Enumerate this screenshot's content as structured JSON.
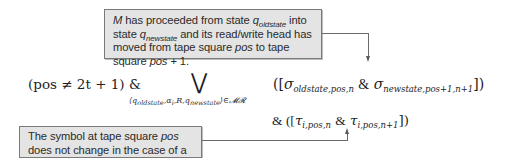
{
  "callouts": {
    "top": {
      "parts": [
        "M",
        " has proceeded from state ",
        "q",
        "oldstate",
        " into state ",
        "q",
        "newstate",
        " and its read/write head has moved from tape square ",
        "pos",
        " to tape square ",
        "pos",
        " + 1."
      ]
    },
    "bottom": {
      "parts": [
        "The symbol at tape square ",
        "pos",
        " does not change in the case of a move-right."
      ]
    }
  },
  "formula": {
    "condition": "(pos ≠ 2t + 1) &",
    "operator": "⋁",
    "range": "⟨q_oldstate, α_i, R, q_newstate⟩ ∈ 𝓜𝓡",
    "range_parts": [
      "⟨q",
      "oldstate",
      ",α",
      "i",
      ",R,q",
      "newstate",
      "⟩∈𝓜𝓡"
    ],
    "sigma_term": {
      "open": "([",
      "a_symbol": "σ",
      "a_sub": "oldstate,pos,n",
      "amp": "&",
      "b_symbol": "σ",
      "b_sub": "newstate,pos+1,n+1",
      "close": "])"
    },
    "tau_term": {
      "lead": "& ([",
      "a_symbol": "τ",
      "a_sub": "i,pos,n",
      "amp": "&",
      "b_symbol": "τ",
      "b_sub": "i,pos,n+1",
      "close": "])"
    }
  },
  "colors": {
    "callout_bg": "#e4e4e4",
    "callout_border": "#7a7a7a",
    "connector": "#6a6a6a"
  }
}
